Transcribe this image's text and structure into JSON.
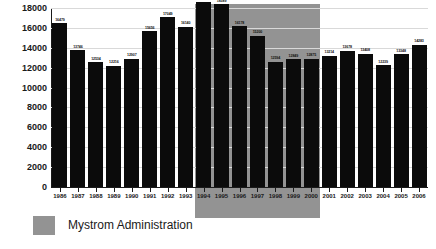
{
  "title": {
    "text": "",
    "cropped": true
  },
  "legend": {
    "label": "Mystrom Administration",
    "swatch_color": "#939393",
    "position": "below-chart-left"
  },
  "colors": {
    "bar": "#0b0b0b",
    "highlight_band": "#939393",
    "gridline": "#d9d9d9",
    "axis": "#1a1a1a",
    "background": "#ffffff"
  },
  "chart_data": {
    "type": "bar",
    "title": "",
    "xlabel": "",
    "ylabel": "",
    "ylim": [
      0,
      18000
    ],
    "yticks": [
      0,
      2000,
      4000,
      6000,
      8000,
      10000,
      12000,
      14000,
      16000,
      18000
    ],
    "ytick_labels": [
      "0",
      "2000",
      "4000",
      "6000",
      "8000",
      "10000",
      "12000",
      "14000",
      "16000",
      "18000"
    ],
    "grid": true,
    "legend_position": "below",
    "categories": [
      "1986",
      "1987",
      "1988",
      "1989",
      "1990",
      "1991",
      "1992",
      "1993",
      "1994",
      "1995",
      "1996",
      "1997",
      "1998",
      "1999",
      "2000",
      "2001",
      "2002",
      "2003",
      "2004",
      "2005",
      "2006"
    ],
    "values": [
      16479,
      13746,
      12534,
      12216,
      12907,
      15656,
      17049,
      16140,
      18642,
      18389,
      16178,
      15200,
      12594,
      12849,
      12875,
      13214,
      13678,
      13408,
      12239,
      13348,
      14283
    ],
    "data_labels": [
      "16479",
      "13746",
      "12534",
      "12216",
      "12907",
      "15656",
      "17049",
      "16140",
      "18642",
      "18389",
      "16178",
      "15200",
      "12594",
      "12849",
      "12875",
      "13214",
      "13678",
      "13408",
      "12239",
      "13348",
      "14283"
    ],
    "annotations": [
      {
        "type": "span-highlight",
        "label": "Mystrom Administration",
        "from_category": "1994",
        "to_category": "2000",
        "color": "#939393"
      }
    ]
  }
}
